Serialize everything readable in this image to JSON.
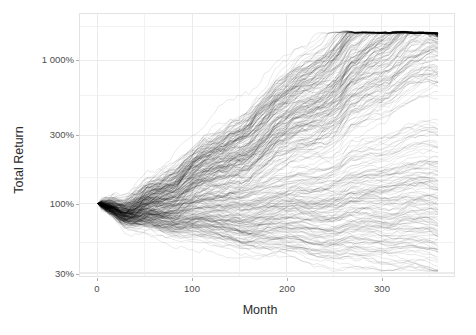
{
  "figure": {
    "background_color": "#ffffff",
    "panel_border_color": "#e3e3e3",
    "grid_color": "#f0f0f0",
    "line_color": "#000000"
  },
  "axes": {
    "y_title": "Total Return",
    "x_title": "Month",
    "y_tick_labels": [
      "1 000%",
      "300%",
      "100%",
      "30%"
    ],
    "x_tick_labels": [
      "0",
      "100",
      "200",
      "300"
    ]
  },
  "caption": {
    "text": ""
  },
  "chart_data": {
    "type": "line",
    "title": "",
    "subtitle": "",
    "xlabel": "Month",
    "ylabel": "Total Return",
    "xlim": [
      -14,
      372
    ],
    "ylim": [
      30,
      1600
    ],
    "yscale": "log",
    "xscale": "linear",
    "grid": true,
    "legend": "none",
    "x_ticks": [
      0,
      100,
      200,
      300
    ],
    "x_tick_labels": [
      "0",
      "100",
      "200",
      "300"
    ],
    "y_ticks": [
      30,
      100,
      300,
      1000
    ],
    "y_tick_labels": [
      "30%",
      "100%",
      "300%",
      "1 000%"
    ],
    "n_paths": 300,
    "start_value_pct": 100,
    "x_start": 0,
    "x_end": 360,
    "annotations": [],
    "series_summary": [
      {
        "name": "max-envelope",
        "x": [
          0,
          60,
          120,
          180,
          200,
          240,
          300,
          360
        ],
        "values": [
          100,
          260,
          430,
          600,
          700,
          620,
          900,
          1450
        ]
      },
      {
        "name": "p90",
        "x": [
          0,
          60,
          120,
          180,
          200,
          240,
          300,
          360
        ],
        "values": [
          100,
          200,
          300,
          420,
          470,
          450,
          620,
          900
        ]
      },
      {
        "name": "median",
        "x": [
          0,
          60,
          120,
          180,
          200,
          240,
          300,
          360
        ],
        "values": [
          100,
          130,
          165,
          200,
          210,
          225,
          260,
          300
        ]
      },
      {
        "name": "p10",
        "x": [
          0,
          60,
          120,
          180,
          200,
          240,
          300,
          360
        ],
        "values": [
          100,
          78,
          72,
          70,
          70,
          72,
          80,
          95
        ]
      },
      {
        "name": "min-envelope",
        "x": [
          0,
          60,
          120,
          180,
          200,
          240,
          300,
          360
        ],
        "values": [
          100,
          48,
          46,
          46,
          46,
          45,
          48,
          56
        ]
      }
    ]
  }
}
